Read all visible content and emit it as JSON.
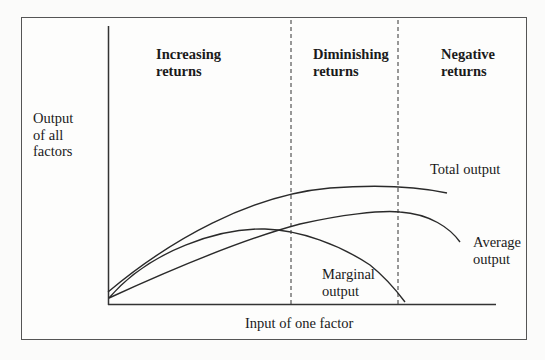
{
  "figure": {
    "y_axis_label": [
      "Output",
      "of all",
      "factors"
    ],
    "x_axis_label": "Input of one factor",
    "regions": [
      {
        "label": [
          "Increasing",
          "returns"
        ]
      },
      {
        "label": [
          "Diminishing",
          "returns"
        ]
      },
      {
        "label": [
          "Negative",
          "returns"
        ]
      }
    ],
    "curves": {
      "total": "Total output",
      "average": [
        "Average",
        "output"
      ],
      "marginal": [
        "Marginal",
        "output"
      ]
    },
    "colors": {
      "line": "#2a2a2a",
      "frame": "#555555",
      "background": "#fbfbfa"
    }
  }
}
